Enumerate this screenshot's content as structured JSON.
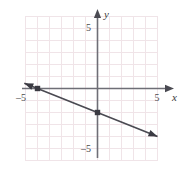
{
  "figure": {
    "kind": "coordinate-plane-line-graph",
    "background_color": "#ffffff",
    "grid_color": "#f0e4e8",
    "axis_color": "#6e6e76",
    "line_color": "#4a4a52",
    "point_color": "#3a3a42"
  },
  "axes": {
    "x_axis_label": "x",
    "y_axis_label": "y",
    "x_tick_labels": [
      {
        "text": "–5",
        "value": -5
      },
      {
        "text": "5",
        "value": 5
      }
    ],
    "y_tick_labels": [
      {
        "text": "5",
        "value": 5
      },
      {
        "text": "–5",
        "value": -5
      }
    ],
    "xlim": [
      -6,
      5.2
    ],
    "ylim": [
      -6,
      6
    ],
    "grid": true,
    "grid_step": 1
  },
  "chart_data": {
    "type": "line",
    "title": "",
    "xlabel": "x",
    "ylabel": "y",
    "xlim": [
      -6,
      5.2
    ],
    "ylim": [
      -6,
      6
    ],
    "grid": true,
    "legend": "none",
    "series": [
      {
        "name": "line",
        "equation": "y = -0.4x - 2",
        "slope": -0.4,
        "y_intercept": -2,
        "x_intercept": -5,
        "arrows": "both",
        "x": [
          -6.1,
          5.0
        ],
        "y": [
          0.44,
          -4.0
        ],
        "marked_points": [
          {
            "x": -5,
            "y": 0,
            "label": "x-intercept"
          },
          {
            "x": 0,
            "y": -2,
            "label": "y-intercept"
          }
        ]
      }
    ]
  }
}
